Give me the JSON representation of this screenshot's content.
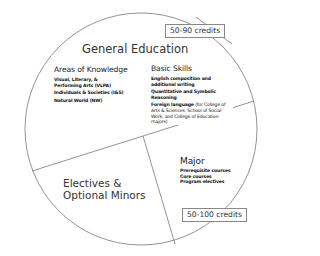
{
  "diagram": {
    "type": "pie-like circle divided into three regions",
    "colors": {
      "outline": "#666666",
      "text": "#2a2a2a",
      "background": "#ffffff"
    }
  },
  "general_education": {
    "title": "General Education",
    "credits": "50-90 credits",
    "areas_of_knowledge": {
      "heading": "Areas of Knowledge",
      "items": [
        "Visual, Literary, & Performing Arts (VLPA)",
        "Individuals & Societies (I&S)",
        "Natural World (NW)"
      ]
    },
    "basic_skills": {
      "heading": "Basic Skills",
      "items": [
        "English composition and additional writing",
        "Quantitative and Symbolic Reasoning"
      ],
      "foreign_language": {
        "label": "Foreign language",
        "note": " (for College of Arts & Sciences, School of Social Work, and College of Education majors)"
      }
    }
  },
  "electives": {
    "line1": "Electives &",
    "line2": "Optional Minors"
  },
  "major": {
    "title": "Major",
    "items": [
      "Prerequisite courses",
      "Core courses",
      "Program electives"
    ],
    "credits": "50-100 credits"
  }
}
